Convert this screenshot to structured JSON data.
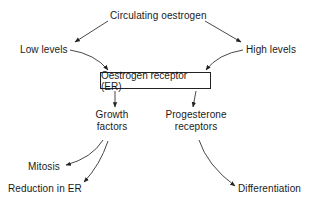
{
  "diagram": {
    "type": "flowchart",
    "nodes": {
      "circulating": {
        "label": "Circulating oestrogen"
      },
      "low": {
        "label": "Low levels"
      },
      "high": {
        "label": "High levels"
      },
      "er": {
        "label": "Oestrogen receptor (ER)",
        "boxed": true
      },
      "growth": {
        "line1": "Growth",
        "line2": "factors"
      },
      "progesterone": {
        "line1": "Progesterone",
        "line2": "receptors"
      },
      "mitosis": {
        "label": "Mitosis"
      },
      "reduction": {
        "label": "Reduction in ER"
      },
      "differentiation": {
        "label": "Differentiation"
      }
    },
    "edges": [
      {
        "from": "Circulating oestrogen",
        "to": "Low levels"
      },
      {
        "from": "Circulating oestrogen",
        "to": "High levels"
      },
      {
        "from": "Low levels",
        "to": "Oestrogen receptor (ER)"
      },
      {
        "from": "High levels",
        "to": "Oestrogen receptor (ER)"
      },
      {
        "from": "Oestrogen receptor (ER)",
        "to": "Growth factors"
      },
      {
        "from": "Oestrogen receptor (ER)",
        "to": "Progesterone receptors"
      },
      {
        "from": "Growth factors",
        "to": "Mitosis"
      },
      {
        "from": "Growth factors",
        "to": "Reduction in ER"
      },
      {
        "from": "Progesterone receptors",
        "to": "Differentiation"
      }
    ],
    "colors": {
      "line": "#333333",
      "text": "#1a1a1a",
      "background": "#ffffff"
    }
  }
}
